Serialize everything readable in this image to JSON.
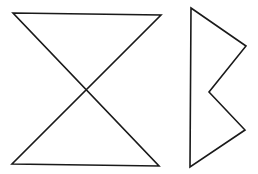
{
  "figure": {
    "stroke_color": "#1a1a1a",
    "background_color": "#ffffff",
    "shapes": [
      {
        "name": "hourglass-shape",
        "description": "Two triangles meeting at a central crossing point (bow-tie / hourglass)",
        "closed": true
      },
      {
        "name": "notched-polygon-shape",
        "description": "Five-sided polygon with a vertical left edge and a notched (zigzag) right side",
        "closed": true
      }
    ]
  }
}
